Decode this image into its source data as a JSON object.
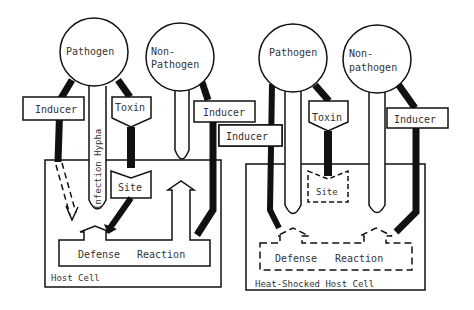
{
  "left_panel": {
    "pathogen_label": "Pathogen",
    "nonpathogen_label_1": "Non-",
    "nonpathogen_label_2": "Pathogen",
    "inducer_left": "Inducer",
    "inducer_right": "Inducer",
    "inducer_far": "Inducer",
    "toxin": "Toxin",
    "hypha": "Infection Hypha",
    "site": "Site",
    "defense": "Defense",
    "reaction": "Reaction",
    "host_cell": "Host Cell"
  },
  "right_panel": {
    "pathogen_label": "Pathogen",
    "nonpathogen_label_1": "Non-",
    "nonpathogen_label_2": "pathogen",
    "toxin": "Toxin",
    "inducer": "Inducer",
    "site": "Site",
    "defense": "Defense",
    "reaction": "Reaction",
    "host_cell": "Heat-Shocked Host Cell"
  },
  "colors": {
    "ink": "#111111",
    "background": "#ffffff"
  }
}
